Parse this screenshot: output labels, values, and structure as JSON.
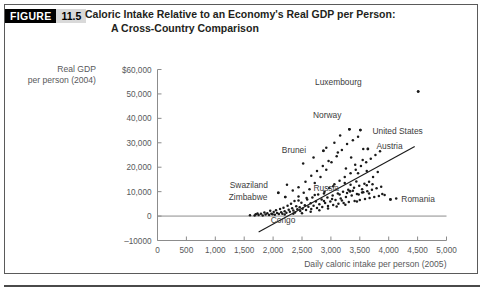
{
  "figure": {
    "badge_word": "FIGURE",
    "badge_number": "11.5",
    "title_line1": "Caloric Intake Relative to an Economy's Real GDP per Person:",
    "title_line2": "A Cross-Country Comparison"
  },
  "chart_data": {
    "type": "scatter",
    "title": "Caloric Intake Relative to an Economy's Real GDP per Person: A Cross-Country Comparison",
    "xlabel": "Daily caloric intake per person (2005)",
    "ylabel_line1": "Real GDP",
    "ylabel_line2": "per person (2004)",
    "xlim": [
      0,
      5000
    ],
    "ylim": [
      -10000,
      60000
    ],
    "xticks": [
      0,
      500,
      1000,
      1500,
      2000,
      2500,
      3000,
      3500,
      4000,
      4500,
      5000
    ],
    "xticklabels": [
      "0",
      "500",
      "1,000",
      "1,500",
      "2,000",
      "2,500",
      "3,000",
      "3,500",
      "4,000",
      "4,500",
      "5,000"
    ],
    "yticks": [
      -10000,
      0,
      10000,
      20000,
      30000,
      40000,
      50000,
      60000
    ],
    "yticklabels": [
      "–10000",
      "0",
      "10,000",
      "20,000",
      "30,000",
      "40,000",
      "50,000",
      "$60,000"
    ],
    "grid": false,
    "legend": "none",
    "marker_color": "#1a1a1a",
    "line_color": "#1a1a1a",
    "axis_color": "#8c8c8c",
    "trendline": {
      "x0": 1750,
      "y0": -6500,
      "x1": 4450,
      "y1": 28500
    },
    "annotations": [
      {
        "label": "Luxembourg",
        "x": 3600,
        "y": 55000,
        "px": 4510,
        "py": 51000
      },
      {
        "label": "Norway",
        "x": 3250,
        "y": 41500,
        "px": 3320,
        "py": 35500
      },
      {
        "label": "United States",
        "x": 3650,
        "y": 35000,
        "px": 3510,
        "py": 35200
      },
      {
        "label": "Austria",
        "x": 3720,
        "y": 28500,
        "px": 3640,
        "py": 27500
      },
      {
        "label": "Brunei",
        "x": 2640,
        "y": 27200,
        "px": 2870,
        "py": 26700
      },
      {
        "label": "Swaziland",
        "x": 1980,
        "y": 12800,
        "px": 2090,
        "py": 9500
      },
      {
        "label": "Zimbabwe",
        "x": 1970,
        "y": 7700,
        "px": 2210,
        "py": 7800
      },
      {
        "label": "Congo",
        "x": 1890,
        "y": -1800,
        "px": 1700,
        "py": 700
      },
      {
        "label": "Russia",
        "x": 3210,
        "y": 11500,
        "px": 3330,
        "py": 10200
      },
      {
        "label": "Romania",
        "x": 4150,
        "y": 7000,
        "px": 4030,
        "py": 6800
      }
    ],
    "points": [
      [
        1600,
        300
      ],
      [
        1680,
        250
      ],
      [
        1730,
        1100
      ],
      [
        1750,
        400
      ],
      [
        1790,
        900
      ],
      [
        1820,
        200
      ],
      [
        1850,
        1500
      ],
      [
        1870,
        600
      ],
      [
        1900,
        1200
      ],
      [
        1930,
        400
      ],
      [
        1950,
        2200
      ],
      [
        1970,
        1000
      ],
      [
        1990,
        700
      ],
      [
        2010,
        1700
      ],
      [
        2030,
        500
      ],
      [
        2050,
        2400
      ],
      [
        2070,
        1300
      ],
      [
        2090,
        9500
      ],
      [
        2100,
        800
      ],
      [
        2120,
        2900
      ],
      [
        2140,
        1600
      ],
      [
        2160,
        1000
      ],
      [
        2180,
        3400
      ],
      [
        2200,
        2000
      ],
      [
        2210,
        7800
      ],
      [
        2230,
        1400
      ],
      [
        2250,
        4200
      ],
      [
        2270,
        2600
      ],
      [
        2290,
        1800
      ],
      [
        2310,
        5000
      ],
      [
        2330,
        3200
      ],
      [
        2350,
        2300
      ],
      [
        2370,
        6200
      ],
      [
        2380,
        1500
      ],
      [
        2400,
        4000
      ],
      [
        2420,
        2800
      ],
      [
        2440,
        8000
      ],
      [
        2460,
        3600
      ],
      [
        2470,
        2100
      ],
      [
        2490,
        5500
      ],
      [
        2510,
        3000
      ],
      [
        2530,
        9500
      ],
      [
        2550,
        4400
      ],
      [
        2570,
        2500
      ],
      [
        2590,
        6800
      ],
      [
        2610,
        3800
      ],
      [
        2630,
        11000
      ],
      [
        2650,
        5200
      ],
      [
        2660,
        2900
      ],
      [
        2680,
        7600
      ],
      [
        2700,
        4200
      ],
      [
        2720,
        13500
      ],
      [
        2740,
        6000
      ],
      [
        2760,
        3300
      ],
      [
        2780,
        8800
      ],
      [
        2800,
        4800
      ],
      [
        2820,
        16000
      ],
      [
        2840,
        6800
      ],
      [
        2850,
        3700
      ],
      [
        2870,
        26700
      ],
      [
        2890,
        10000
      ],
      [
        2900,
        5400
      ],
      [
        2920,
        19000
      ],
      [
        2940,
        7600
      ],
      [
        2950,
        4100
      ],
      [
        2970,
        11500
      ],
      [
        2990,
        6000
      ],
      [
        3010,
        22000
      ],
      [
        3030,
        8400
      ],
      [
        3040,
        4500
      ],
      [
        3060,
        13000
      ],
      [
        3080,
        6600
      ],
      [
        3100,
        24500
      ],
      [
        3120,
        9200
      ],
      [
        3130,
        5000
      ],
      [
        3150,
        14500
      ],
      [
        3170,
        7200
      ],
      [
        3190,
        27000
      ],
      [
        3210,
        10000
      ],
      [
        3220,
        5400
      ],
      [
        3240,
        16000
      ],
      [
        3260,
        7800
      ],
      [
        3280,
        29500
      ],
      [
        3300,
        10800
      ],
      [
        3310,
        5800
      ],
      [
        3320,
        35500
      ],
      [
        3340,
        17500
      ],
      [
        3360,
        8400
      ],
      [
        3380,
        31000
      ],
      [
        3400,
        11600
      ],
      [
        3410,
        6200
      ],
      [
        3430,
        19000
      ],
      [
        3450,
        9000
      ],
      [
        3470,
        32500
      ],
      [
        3490,
        12400
      ],
      [
        3500,
        6600
      ],
      [
        3510,
        35200
      ],
      [
        3520,
        20500
      ],
      [
        3540,
        9600
      ],
      [
        3560,
        27500
      ],
      [
        3580,
        13200
      ],
      [
        3590,
        7000
      ],
      [
        3610,
        22000
      ],
      [
        3630,
        10200
      ],
      [
        3640,
        27500
      ],
      [
        3660,
        14000
      ],
      [
        3670,
        7400
      ],
      [
        3690,
        23500
      ],
      [
        3710,
        10800
      ],
      [
        3730,
        16000
      ],
      [
        3750,
        7800
      ],
      [
        3770,
        25000
      ],
      [
        3790,
        11400
      ],
      [
        3810,
        18000
      ],
      [
        3830,
        8200
      ],
      [
        3850,
        26500
      ],
      [
        3870,
        12000
      ],
      [
        3890,
        9000
      ],
      [
        3930,
        8600
      ],
      [
        4030,
        6800
      ],
      [
        4130,
        7200
      ],
      [
        4510,
        51000
      ],
      [
        2240,
        12800
      ],
      [
        2560,
        14000
      ],
      [
        2660,
        16500
      ],
      [
        2760,
        18500
      ],
      [
        2860,
        20500
      ],
      [
        2340,
        10500
      ],
      [
        2440,
        11800
      ],
      [
        2960,
        22500
      ],
      [
        3060,
        30000
      ],
      [
        3160,
        33000
      ],
      [
        2880,
        9200
      ],
      [
        3040,
        12200
      ],
      [
        3240,
        13500
      ],
      [
        3340,
        12800
      ],
      [
        3440,
        14200
      ],
      [
        3540,
        11000
      ],
      [
        3620,
        12600
      ],
      [
        3720,
        13000
      ],
      [
        3150,
        8800
      ],
      [
        3280,
        9400
      ],
      [
        3380,
        10400
      ],
      [
        3480,
        8800
      ],
      [
        3560,
        9800
      ],
      [
        3660,
        9200
      ],
      [
        2200,
        600
      ],
      [
        2350,
        900
      ],
      [
        2500,
        1200
      ],
      [
        2650,
        1800
      ],
      [
        2800,
        2400
      ],
      [
        2950,
        3100
      ],
      [
        3100,
        3900
      ],
      [
        3250,
        4600
      ],
      [
        2520,
        21500
      ],
      [
        2700,
        24000
      ],
      [
        2920,
        28000
      ],
      [
        3120,
        26000
      ],
      [
        3350,
        24000
      ],
      [
        3420,
        21000
      ],
      [
        3550,
        23000
      ],
      [
        3260,
        19500
      ],
      [
        3470,
        17500
      ],
      [
        3620,
        18500
      ],
      [
        2440,
        6400
      ],
      [
        2580,
        7400
      ],
      [
        2720,
        8600
      ],
      [
        2880,
        6200
      ],
      [
        3020,
        7000
      ],
      [
        3190,
        6400
      ],
      [
        3330,
        10200
      ],
      [
        3450,
        6000
      ]
    ]
  }
}
